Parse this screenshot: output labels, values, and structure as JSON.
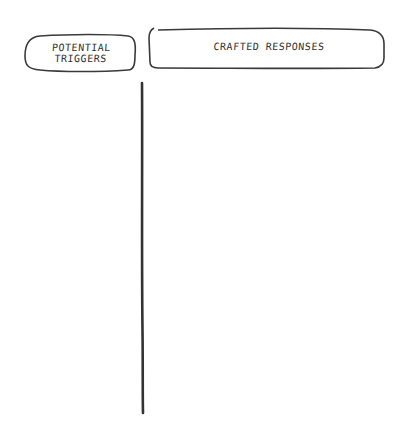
{
  "diagram": {
    "headers": [
      {
        "id": "left",
        "line1": "POTENTIAL",
        "line2": "TRIGGERS"
      },
      {
        "id": "right",
        "line1": "CRAFTED RESPONSES"
      }
    ],
    "divider": {
      "orientation": "vertical"
    },
    "colors": {
      "stroke": "#333333",
      "background": "#ffffff"
    }
  }
}
